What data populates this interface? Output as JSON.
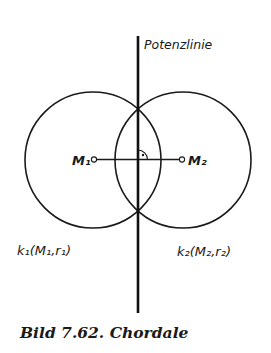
{
  "figure": {
    "caption": "Bild 7.62. Chordale",
    "line_label": "Potenzlinie",
    "colors": {
      "stroke": "#1a1a1a",
      "background": "#ffffff"
    },
    "circles": [
      {
        "name": "k1",
        "label": "k₁(M₁,r₁)",
        "center_label": "M₁",
        "cx": 93,
        "cy": 160,
        "r": 68
      },
      {
        "name": "k2",
        "label": "k₂(M₂,r₂)",
        "center_label": "M₂",
        "cx": 183,
        "cy": 160,
        "r": 68
      }
    ],
    "power_line": {
      "x": 138,
      "y1": 36,
      "y2": 313
    },
    "intersections": [
      {
        "x": 138,
        "y": 109
      },
      {
        "x": 138,
        "y": 211
      }
    ],
    "right_angle_marker": true
  }
}
